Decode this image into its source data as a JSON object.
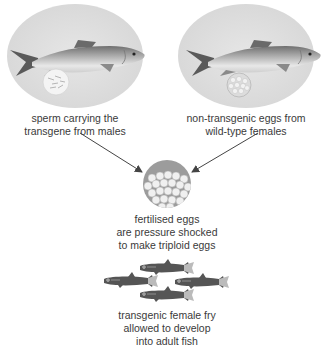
{
  "diagram": {
    "nodes": {
      "male": {
        "label_line1": "sperm carrying the",
        "label_line2": "transgene from males",
        "image": "adult-salmon-with-sperm-icon"
      },
      "female": {
        "label_line1": "non-transgenic eggs from",
        "label_line2": "wild-type females",
        "image": "adult-salmon-with-eggs-icon"
      },
      "fertilised": {
        "label_line1": "fertilised eggs",
        "label_line2": "are pressure shocked",
        "label_line3": "to make triploid eggs",
        "image": "egg-cluster-icon"
      },
      "fry": {
        "label_line1": "transgenic female fry",
        "label_line2": "allowed to develop",
        "label_line3": "into adult fish",
        "image": "fish-fry-group-icon",
        "count": 4
      }
    },
    "edges": [
      {
        "from": "male",
        "to": "fertilised"
      },
      {
        "from": "female",
        "to": "fertilised"
      }
    ],
    "colors": {
      "ellipse_bg": "#e2e2e2",
      "fish_body": "#9a9a9a",
      "fry_body": "#555555",
      "arrow": "#444444",
      "text": "#3a3a3a"
    }
  }
}
